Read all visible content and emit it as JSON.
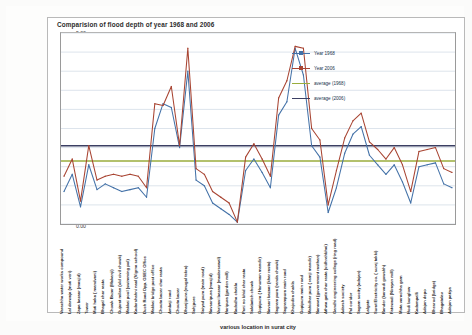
{
  "chart_data": {
    "type": "line",
    "title": "Comparision of flood depth of year 1968 and 2006",
    "xlabel": "various  location in surat city",
    "ylabel": "flood depth",
    "ylim": [
      0,
      5
    ],
    "ytick_step": 0.5,
    "grid": true,
    "legend_position": "inside-top-right",
    "ytick_labels": [
      "0.00",
      "0.50",
      "1.00",
      "1.50",
      "2.00",
      "2.50",
      "3.00",
      "3.50",
      "4.00",
      "4.50",
      "5.00"
    ],
    "categories": [
      "Varachha water works compound",
      "Lal darwaja (moti veri)",
      "Zapa bazaar (masjid)",
      "Tower",
      "Moti haka ( mandvani)",
      "Bhagal char rasta",
      "Chowk Bazar (Makanji)",
      "Gujarat milan (old civil chowk)",
      "Makkai pool (swimming pol)",
      "Kadarshahni naal (Vigrna school)",
      "Duch Road Opp. GSEC Office",
      "Makkai bridge post office",
      "Chouta bazar char rasta",
      "Ambaji road",
      "Chouta bazar",
      "Dhanjipura (mugal tekra)",
      "Sahjpore",
      "Saiyad pura (main road)",
      "Navsaripura (masjid)",
      "Variyavi bazaar (madarsewal)",
      "Haripura (garden mill)",
      "Radedha chakla",
      "Pani no bhid char rasta",
      "Salabatch chowk",
      "Gopipura ( Hanuman mandir)",
      "Navsari bazaar (khar rasta)",
      "Sagram pura (randa chowk)",
      "Sagrampura main road",
      "Khajodira chakla",
      "Gopipura main road",
      "Mahidhar pura ( ramji mandir)",
      "Nanavat (government rasthan)",
      "Athwa gate char rasta (vidhrahbhai)",
      "Gandhi engineering college (ring road)",
      "Adarsh society",
      "Pal coridor",
      "Sagam socity (adajan)",
      "Lalgate",
      "Surat Electricity co. ( suraj takki)",
      "Rander (karvadi gowshh)",
      "Fatewadi (Nirayan mill)",
      "Mota varachha gam",
      "Hodi bunglow",
      "Kadampalli",
      "Adajan depo",
      "Bhesrod (bridge)",
      "Bhagatalav",
      "Adajan patiya"
    ],
    "series": [
      {
        "name": "Year 1968",
        "color": "#4472a8",
        "values": [
          0.85,
          1.3,
          0.45,
          1.55,
          0.9,
          1.05,
          0.95,
          0.85,
          0.9,
          0.95,
          0.7,
          2.5,
          3.15,
          3.05,
          2.0,
          4.0,
          1.15,
          1.0,
          0.55,
          0.4,
          0.25,
          0.05,
          1.4,
          1.7,
          1.35,
          0.95,
          2.85,
          3.2,
          4.6,
          3.9,
          2.05,
          1.75,
          0.3,
          0.95,
          1.85,
          2.35,
          2.55,
          1.8,
          1.55,
          1.3,
          1.55,
          1.1,
          0.55,
          1.5,
          1.55,
          1.6,
          1.05,
          0.95
        ]
      },
      {
        "name": "Year 2006",
        "color": "#a84432",
        "values": [
          1.25,
          1.7,
          0.6,
          2.05,
          1.15,
          1.25,
          1.3,
          1.25,
          1.3,
          1.25,
          0.95,
          3.15,
          3.1,
          3.6,
          2.05,
          4.6,
          1.45,
          1.3,
          0.85,
          0.7,
          0.55,
          0.05,
          1.75,
          2.1,
          1.7,
          1.25,
          3.3,
          3.75,
          4.65,
          4.6,
          2.5,
          2.2,
          0.5,
          1.4,
          2.25,
          2.7,
          2.9,
          2.15,
          1.95,
          1.7,
          2.0,
          1.55,
          0.85,
          1.9,
          1.95,
          2.0,
          1.45,
          1.35
        ]
      }
    ],
    "average_lines": [
      {
        "name": "average (1968)",
        "value": 1.65,
        "color": "#9aad3c"
      },
      {
        "name": "average (2006)",
        "value": 2.05,
        "color": "#3b3f63"
      }
    ]
  }
}
